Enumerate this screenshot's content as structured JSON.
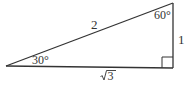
{
  "diagram": {
    "type": "right-triangle",
    "colors": {
      "stroke": "#333333",
      "text": "#333333",
      "background": "#ffffff"
    },
    "vertices": {
      "left": {
        "x": 6,
        "y": 66,
        "angle_label": "30°"
      },
      "top_right": {
        "x": 173,
        "y": 3,
        "angle_label": "60°"
      },
      "bottom_right": {
        "x": 173,
        "y": 68,
        "angle_label": "right angle"
      }
    },
    "sides": {
      "hypotenuse": {
        "label": "2"
      },
      "vertical_leg": {
        "label": "1"
      },
      "base": {
        "label": "√3",
        "radicand": "3"
      }
    }
  }
}
